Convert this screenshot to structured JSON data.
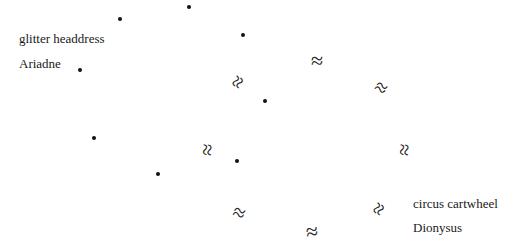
{
  "labels": [
    {
      "id": "glitter-headdress",
      "text": "glitter headdress",
      "x": 19,
      "y": 31
    },
    {
      "id": "ariadne",
      "text": "Ariadne",
      "x": 19,
      "y": 56
    },
    {
      "id": "circus-cartwheel",
      "text": "circus cartwheel",
      "x": 413,
      "y": 196
    },
    {
      "id": "dionysus",
      "text": "Dionysus",
      "x": 413,
      "y": 220
    }
  ],
  "dots": [
    {
      "x": 120,
      "y": 19
    },
    {
      "x": 189,
      "y": 7
    },
    {
      "x": 80,
      "y": 70
    },
    {
      "x": 243,
      "y": 35
    },
    {
      "x": 265,
      "y": 101
    },
    {
      "x": 94,
      "y": 138
    },
    {
      "x": 158,
      "y": 174
    },
    {
      "x": 237,
      "y": 161
    }
  ],
  "approx_symbols": [
    {
      "glyph": "≈",
      "x": 238,
      "y": 82,
      "rotate": -60
    },
    {
      "glyph": "≈",
      "x": 317,
      "y": 61,
      "rotate": 0
    },
    {
      "glyph": "≈",
      "x": 381,
      "y": 88,
      "rotate": 30
    },
    {
      "glyph": "≈",
      "x": 207,
      "y": 150,
      "rotate": 95
    },
    {
      "glyph": "≈",
      "x": 404,
      "y": 150,
      "rotate": 95
    },
    {
      "glyph": "≈",
      "x": 239,
      "y": 213,
      "rotate": 20
    },
    {
      "glyph": "≈",
      "x": 312,
      "y": 232,
      "rotate": -8
    },
    {
      "glyph": "≈",
      "x": 379,
      "y": 209,
      "rotate": -60
    }
  ]
}
